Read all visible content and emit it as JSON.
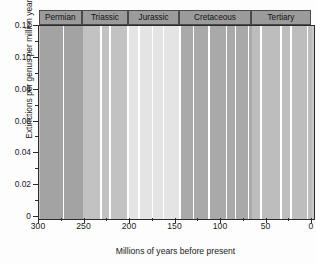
{
  "chart_data": {
    "type": "line",
    "title": "",
    "xlabel": "Millions of years before present",
    "ylabel": "Extinctions per genus per million years",
    "xlim": [
      300,
      0
    ],
    "ylim": [
      0,
      0.12
    ],
    "x_reversed": true,
    "grid": false,
    "legend": null,
    "ytick_labels": [
      "0",
      "0.02",
      "0.04",
      "0.06",
      "0.08",
      "0.10",
      "0.12"
    ],
    "ytick_values": [
      0,
      0.02,
      0.04,
      0.06,
      0.08,
      0.1,
      0.12
    ],
    "ytick_minor_step": 0.01,
    "xtick_labels": [
      "300",
      "250",
      "200",
      "150",
      "100",
      "50",
      "0"
    ],
    "xtick_values": [
      300,
      250,
      200,
      150,
      100,
      50,
      0
    ],
    "xtick_minor_step": 25,
    "series": [
      {
        "name": "Extinction intensity",
        "marker": "square",
        "color": "#161616",
        "points": [
          [
            262,
            0.0232
          ],
          [
            257,
            0.0315
          ],
          [
            254,
            0.099
          ],
          [
            252,
            0.1122
          ],
          [
            250,
            0.0347
          ],
          [
            246,
            0.0152
          ],
          [
            242,
            0.014
          ],
          [
            238,
            0.0123
          ],
          [
            234,
            0.0175
          ],
          [
            230,
            0.0228
          ],
          [
            226,
            0.0212
          ],
          [
            222,
            0.0175
          ],
          [
            216,
            0.031
          ],
          [
            210,
            0.0452
          ],
          [
            204,
            0.07
          ],
          [
            202,
            0.03
          ],
          [
            200,
            0.0072
          ],
          [
            197,
            0.0066
          ],
          [
            194,
            0.007
          ],
          [
            190,
            0.0148
          ],
          [
            187,
            0.0196
          ],
          [
            184,
            0.015
          ],
          [
            181,
            0.011
          ],
          [
            178,
            0.012
          ],
          [
            175,
            0.015
          ],
          [
            172,
            0.0138
          ],
          [
            169,
            0.0106
          ],
          [
            166,
            0.0128
          ],
          [
            163,
            0.0125
          ],
          [
            160,
            0.012
          ],
          [
            157,
            0.0145
          ],
          [
            154,
            0.015
          ],
          [
            152,
            0.0172
          ],
          [
            150,
            0.019
          ],
          [
            148,
            0.0298
          ],
          [
            146,
            0.0185
          ],
          [
            144,
            0.0082
          ],
          [
            141,
            0.0076
          ],
          [
            137,
            0.0088
          ],
          [
            133,
            0.0096
          ],
          [
            129,
            0.01
          ],
          [
            125,
            0.0115
          ],
          [
            121,
            0.0108
          ],
          [
            117,
            0.021
          ],
          [
            113,
            0.015
          ],
          [
            109,
            0.0085
          ],
          [
            105,
            0.0062
          ],
          [
            101,
            0.0105
          ],
          [
            97,
            0.016
          ],
          [
            94,
            0.0248
          ],
          [
            91,
            0.0155
          ],
          [
            88,
            0.01
          ],
          [
            85,
            0.009
          ],
          [
            80,
            0.0105
          ],
          [
            75,
            0.0112
          ],
          [
            71,
            0.0108
          ],
          [
            68,
            0.0196
          ],
          [
            66,
            0.046
          ],
          [
            64,
            0.0155
          ],
          [
            61,
            0.012
          ],
          [
            58,
            0.0092
          ],
          [
            55,
            0.0068
          ],
          [
            50,
            0.007
          ],
          [
            46,
            0.0098
          ],
          [
            42,
            0.0215
          ],
          [
            38,
            0.012
          ],
          [
            34,
            0.0088
          ],
          [
            30,
            0.0055
          ],
          [
            25,
            0.0035
          ],
          [
            21,
            0.004
          ],
          [
            17,
            0.0092
          ],
          [
            13,
            0.018
          ],
          [
            9,
            0.014
          ],
          [
            5,
            0.0098
          ],
          [
            1,
            0.0115
          ]
        ]
      }
    ],
    "period_bands": [
      {
        "label": "Permian",
        "start": 299,
        "end": 252,
        "shade": "#a3a3a3"
      },
      {
        "label": "Triassic",
        "start": 252,
        "end": 201,
        "shade": "#c2c2c2"
      },
      {
        "label": "Jurassic",
        "start": 201,
        "end": 145,
        "shade": "#e4e4e4"
      },
      {
        "label": "Cretaceous",
        "start": 145,
        "end": 66,
        "shade": "#a9a9a9"
      },
      {
        "label": "Tertiary",
        "start": 66,
        "end": 0,
        "shade": "#bdbdbd"
      }
    ],
    "band_subdividers": [
      273,
      232,
      222,
      202,
      190,
      175,
      163,
      145,
      130,
      113,
      94,
      84,
      70,
      56,
      34,
      23,
      5
    ],
    "annotations": []
  },
  "axes": {
    "ylabel": "Extinctions per genus per million years",
    "xlabel": "Millions of years before present"
  },
  "colors": {
    "line": "#161616",
    "frame": "#2b2b2b",
    "header_fill": "#9b9b9b",
    "divider": "#ffffff",
    "background": "#fdfdfd"
  }
}
